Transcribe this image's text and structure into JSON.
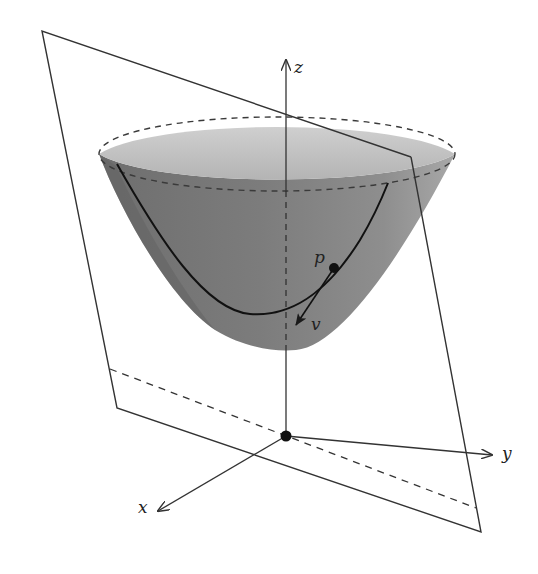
{
  "figure": {
    "labels": {
      "z_axis": "z",
      "y_axis": "y",
      "x_axis": "x",
      "point": "p",
      "vector": "v"
    },
    "colors": {
      "line": "#333333",
      "surface_inner_light": "#c4c4c4",
      "surface_outer_dark": "#7a7a7a",
      "surface_mid": "#9a9a9a",
      "background": "#ffffff"
    },
    "elements": [
      "tilted-plane",
      "plane-dashed-line",
      "paraboloid-surface",
      "paraboloid-rim-dashed-ellipse",
      "intersection-curve",
      "point-p",
      "tangent-vector-v",
      "z-axis",
      "y-axis",
      "x-axis",
      "origin-point"
    ]
  }
}
